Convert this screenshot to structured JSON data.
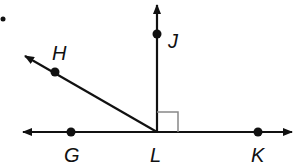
{
  "diagram": {
    "type": "geometry-angles",
    "colors": {
      "stroke": "#111111",
      "right_angle_marker": "#888888",
      "background": "#ffffff"
    },
    "bullet": {
      "x": 3,
      "y": 19
    },
    "vertex": {
      "label": "L",
      "x": 157,
      "y": 132
    },
    "points": [
      {
        "id": "H",
        "label": "H",
        "x": 55,
        "y": 72,
        "label_x": 52,
        "label_y": 60
      },
      {
        "id": "J",
        "label": "J",
        "x": 157,
        "y": 34,
        "label_x": 168,
        "label_y": 48
      },
      {
        "id": "G",
        "label": "G",
        "x": 71,
        "y": 132,
        "label_x": 64,
        "label_y": 162
      },
      {
        "id": "L",
        "label": "L",
        "x": 157,
        "y": 132,
        "label_x": 150,
        "label_y": 162
      },
      {
        "id": "K",
        "label": "K",
        "x": 258,
        "y": 132,
        "label_x": 251,
        "label_y": 162
      }
    ],
    "lines": [
      {
        "id": "line-GK",
        "kind": "line",
        "through": [
          "G",
          "L",
          "K"
        ],
        "from": [
          22,
          132
        ],
        "to": [
          293,
          132
        ]
      },
      {
        "id": "ray-LJ",
        "kind": "ray",
        "through": [
          "L",
          "J"
        ],
        "from": [
          157,
          132
        ],
        "to": [
          157,
          4
        ]
      },
      {
        "id": "ray-LH",
        "kind": "ray",
        "through": [
          "L",
          "H"
        ],
        "from": [
          157,
          132
        ],
        "to": [
          24,
          55
        ]
      }
    ],
    "right_angle": {
      "at": "L",
      "between": [
        "LJ",
        "LK"
      ],
      "size": 21
    }
  }
}
